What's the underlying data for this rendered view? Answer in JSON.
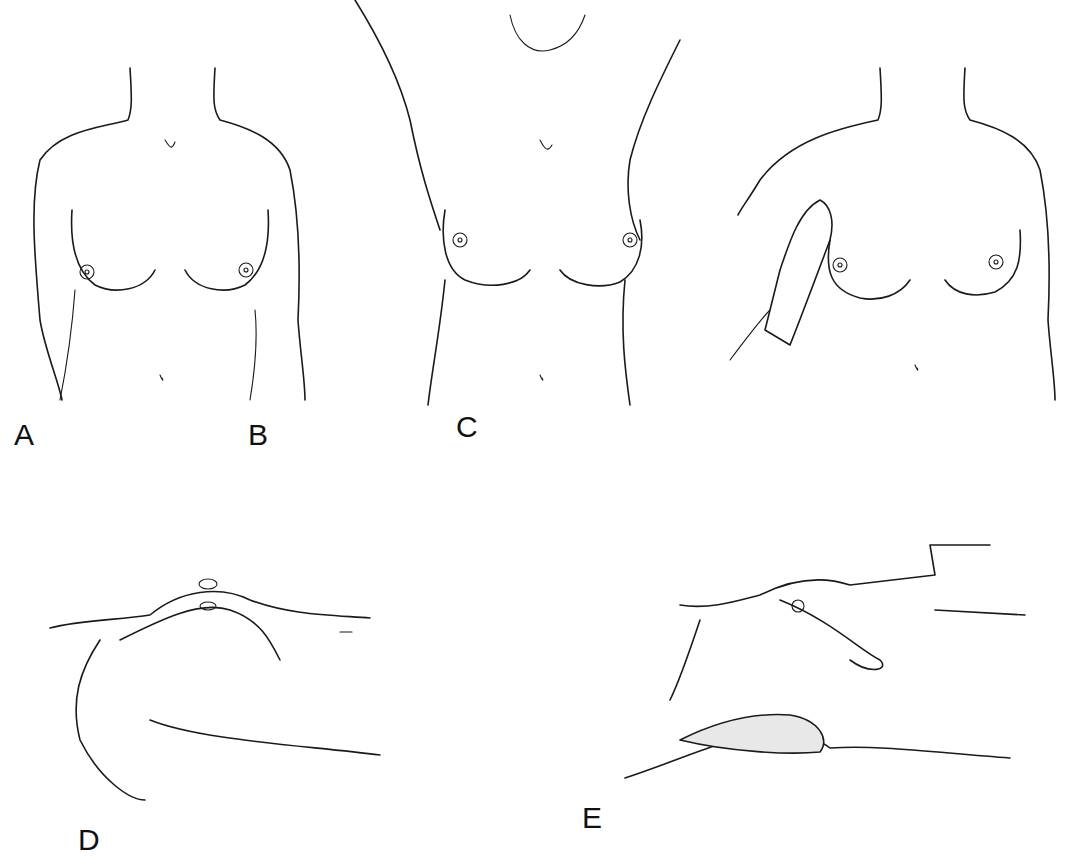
{
  "figure": {
    "panels": [
      {
        "id": "A",
        "label": "A",
        "description": "Inspection, patient seated with arms at sides"
      },
      {
        "id": "B",
        "label": "B",
        "description": "Inspection, patient seated with arms raised overhead"
      },
      {
        "id": "C",
        "label": "C",
        "description": "Inspection, patient pressing hands together / palpation of breast"
      },
      {
        "id": "D",
        "label": "D",
        "description": "Supine palpation with arm raised"
      },
      {
        "id": "E",
        "label": "E",
        "description": "Supine palpation by examiner's hand with shaded roll under shoulder"
      }
    ],
    "colors": {
      "line": "#1a1a1a",
      "background": "#ffffff"
    }
  }
}
